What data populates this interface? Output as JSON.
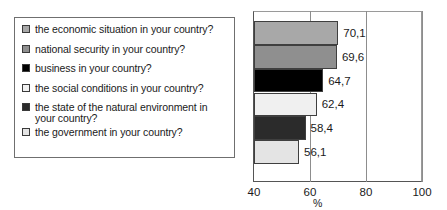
{
  "chart_data": {
    "type": "bar",
    "orientation": "horizontal",
    "title": "",
    "xlabel": "%",
    "ylabel": "",
    "xlim": [
      40,
      100
    ],
    "xticks": [
      40,
      60,
      80,
      100
    ],
    "grid": true,
    "legend_position": "left",
    "categories": [
      "the economic situation in your country?",
      "national security in your country?",
      "business in your country?",
      "the social conditions in your country?",
      "the state of the natural environment in your country?",
      "the government in your country?"
    ],
    "values": [
      70.1,
      69.6,
      64.7,
      62.4,
      58.4,
      56.1
    ],
    "value_labels": [
      "70,1",
      "69,6",
      "64,7",
      "62,4",
      "58,4",
      "56,1"
    ],
    "colors": [
      "#a8a8a8",
      "#8f8f8f",
      "#000000",
      "#f0f0f0",
      "#2b2b2b",
      "#e4e4e4"
    ]
  },
  "legend": {
    "items": [
      {
        "label": "the economic situation in your country?",
        "color": "#a8a8a8"
      },
      {
        "label": "national security in your country?",
        "color": "#8f8f8f"
      },
      {
        "label": "business in your country?",
        "color": "#000000"
      },
      {
        "label": "the social conditions in your country?",
        "color": "#f0f0f0"
      },
      {
        "label": "the state of the natural environment in your country?",
        "color": "#2b2b2b"
      },
      {
        "label": "the government in your country?",
        "color": "#e4e4e4"
      }
    ]
  },
  "axis": {
    "tick_labels": [
      "40",
      "60",
      "80",
      "100"
    ],
    "unit_label": "%"
  }
}
